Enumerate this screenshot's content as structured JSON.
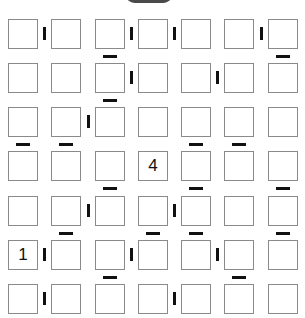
{
  "puzzle": {
    "type": "futoshiki-adjacency",
    "rows": 7,
    "cols": 7,
    "colors": {
      "cell_border": "#8a8a8a",
      "bar": "#111111",
      "top_button": "#4a4a4a"
    },
    "givens": [
      {
        "row": 3,
        "col": 3,
        "value": "4"
      },
      {
        "row": 5,
        "col": 0,
        "value": "1"
      }
    ],
    "vertical_bars": [
      [
        0,
        0
      ],
      [
        0,
        2
      ],
      [
        0,
        3
      ],
      [
        0,
        5
      ],
      [
        1,
        2
      ],
      [
        1,
        4
      ],
      [
        2,
        1
      ],
      [
        4,
        1
      ],
      [
        4,
        3
      ],
      [
        5,
        0
      ],
      [
        5,
        2
      ],
      [
        5,
        4
      ],
      [
        6,
        0
      ],
      [
        6,
        3
      ]
    ],
    "horizontal_bars": [
      [
        0,
        2
      ],
      [
        0,
        6
      ],
      [
        1,
        2
      ],
      [
        2,
        0
      ],
      [
        2,
        1
      ],
      [
        2,
        4
      ],
      [
        2,
        5
      ],
      [
        3,
        2
      ],
      [
        3,
        4
      ],
      [
        3,
        6
      ],
      [
        4,
        1
      ],
      [
        4,
        3
      ],
      [
        4,
        4
      ],
      [
        4,
        6
      ],
      [
        5,
        2
      ],
      [
        5,
        5
      ]
    ]
  }
}
